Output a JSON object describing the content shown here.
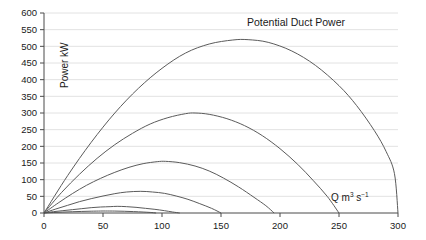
{
  "chart_data": {
    "type": "line",
    "title": "Potential Duct Power",
    "xlabel": "Q m3 s-1",
    "xlabel_base": "Q m",
    "xlabel_sup1": "3",
    "xlabel_mid": " s",
    "xlabel_sup2": "−1",
    "ylabel": "Power kW",
    "xlim": [
      0,
      300
    ],
    "ylim": [
      0,
      600
    ],
    "xticks": [
      0,
      50,
      100,
      150,
      200,
      250,
      300
    ],
    "yticks": [
      0,
      50,
      100,
      150,
      200,
      250,
      300,
      350,
      400,
      450,
      500,
      550,
      600
    ],
    "grid": true,
    "legend": "none",
    "axis_color": "#4a4a4a",
    "grid_color": "#e2e2e2",
    "curve_color": "#5b5b5b",
    "background": "#ffffff",
    "series": [
      {
        "name": "curve-1",
        "q_zero": 300,
        "peak_q": 173,
        "peak_power": 520,
        "points": [
          [
            0,
            0
          ],
          [
            20,
            112
          ],
          [
            40,
            212
          ],
          [
            60,
            300
          ],
          [
            80,
            374
          ],
          [
            100,
            434
          ],
          [
            120,
            480
          ],
          [
            140,
            507
          ],
          [
            160,
            519
          ],
          [
            173,
            520
          ],
          [
            190,
            512
          ],
          [
            210,
            486
          ],
          [
            230,
            443
          ],
          [
            250,
            382
          ],
          [
            265,
            322
          ],
          [
            280,
            247
          ],
          [
            290,
            184
          ],
          [
            297,
            118
          ],
          [
            300,
            0
          ]
        ]
      },
      {
        "name": "curve-2",
        "q_zero": 250,
        "peak_q": 128,
        "peak_power": 300,
        "points": [
          [
            0,
            0
          ],
          [
            15,
            62
          ],
          [
            30,
            116
          ],
          [
            45,
            164
          ],
          [
            60,
            205
          ],
          [
            75,
            239
          ],
          [
            90,
            267
          ],
          [
            105,
            286
          ],
          [
            120,
            298
          ],
          [
            128,
            300
          ],
          [
            140,
            296
          ],
          [
            155,
            283
          ],
          [
            170,
            262
          ],
          [
            185,
            232
          ],
          [
            200,
            193
          ],
          [
            215,
            146
          ],
          [
            228,
            98
          ],
          [
            240,
            50
          ],
          [
            250,
            0
          ]
        ]
      },
      {
        "name": "curve-3",
        "q_zero": 195,
        "peak_q": 103,
        "peak_power": 155,
        "points": [
          [
            0,
            0
          ],
          [
            12,
            30
          ],
          [
            24,
            58
          ],
          [
            36,
            83
          ],
          [
            48,
            104
          ],
          [
            60,
            122
          ],
          [
            72,
            137
          ],
          [
            84,
            148
          ],
          [
            96,
            154
          ],
          [
            103,
            155
          ],
          [
            115,
            151
          ],
          [
            128,
            141
          ],
          [
            140,
            126
          ],
          [
            152,
            105
          ],
          [
            165,
            78
          ],
          [
            178,
            47
          ],
          [
            188,
            22
          ],
          [
            195,
            0
          ]
        ]
      },
      {
        "name": "curve-4",
        "q_zero": 150,
        "peak_q": 82,
        "peak_power": 65,
        "points": [
          [
            0,
            0
          ],
          [
            10,
            12
          ],
          [
            20,
            23
          ],
          [
            30,
            34
          ],
          [
            40,
            43
          ],
          [
            50,
            51
          ],
          [
            60,
            58
          ],
          [
            70,
            63
          ],
          [
            82,
            65
          ],
          [
            92,
            63
          ],
          [
            102,
            59
          ],
          [
            112,
            51
          ],
          [
            122,
            41
          ],
          [
            132,
            28
          ],
          [
            142,
            14
          ],
          [
            150,
            0
          ]
        ]
      },
      {
        "name": "curve-5",
        "q_zero": 115,
        "peak_q": 62,
        "peak_power": 20,
        "points": [
          [
            0,
            0
          ],
          [
            8,
            4
          ],
          [
            16,
            7
          ],
          [
            24,
            10
          ],
          [
            32,
            13
          ],
          [
            40,
            16
          ],
          [
            48,
            18
          ],
          [
            56,
            19
          ],
          [
            62,
            20
          ],
          [
            70,
            19
          ],
          [
            78,
            17
          ],
          [
            86,
            14
          ],
          [
            94,
            11
          ],
          [
            102,
            7
          ],
          [
            109,
            3
          ],
          [
            115,
            0
          ]
        ]
      },
      {
        "name": "curve-6",
        "q_zero": 95,
        "peak_q": 52,
        "peak_power": 6,
        "points": [
          [
            0,
            0
          ],
          [
            8,
            1.5
          ],
          [
            16,
            2.8
          ],
          [
            24,
            3.8
          ],
          [
            32,
            4.7
          ],
          [
            40,
            5.4
          ],
          [
            48,
            5.9
          ],
          [
            52,
            6
          ],
          [
            60,
            5.8
          ],
          [
            68,
            5.2
          ],
          [
            76,
            4.2
          ],
          [
            84,
            2.9
          ],
          [
            90,
            1.7
          ],
          [
            95,
            0
          ]
        ]
      }
    ]
  }
}
